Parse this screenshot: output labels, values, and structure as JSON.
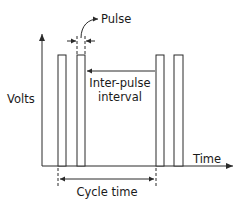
{
  "diagram": {
    "axes": {
      "y_label": "Volts",
      "x_label": "Time"
    },
    "annotations": {
      "pulse": "Pulse",
      "inter_pulse_line1": "Inter-pulse",
      "inter_pulse_line2": "interval",
      "cycle_time": "Cycle time"
    },
    "pulses": [
      {
        "x0": 58,
        "x1": 66
      },
      {
        "x0": 77,
        "x1": 85
      },
      {
        "x0": 156,
        "x1": 164
      },
      {
        "x0": 174,
        "x1": 183
      }
    ],
    "colors": {
      "line": "#2a2a2a",
      "text": "#1a1a1a",
      "background": "#ffffff"
    }
  }
}
